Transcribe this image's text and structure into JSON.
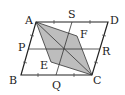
{
  "diagram": {
    "type": "geometry",
    "colors": {
      "line": "#222222",
      "fill": "#bdbdbd",
      "background": "#ffffff"
    },
    "points": {
      "A": {
        "label": "A",
        "x": 36,
        "y": 22
      },
      "D": {
        "label": "D",
        "x": 108,
        "y": 22
      },
      "B": {
        "label": "B",
        "x": 21,
        "y": 75
      },
      "C": {
        "label": "C",
        "x": 92,
        "y": 75
      },
      "S": {
        "label": "S",
        "x": 72,
        "y": 22
      },
      "Q": {
        "label": "Q",
        "x": 56,
        "y": 75
      },
      "P": {
        "label": "P",
        "x": 28,
        "y": 49
      },
      "R": {
        "label": "R",
        "x": 100,
        "y": 49
      },
      "E": {
        "label": "E",
        "x": 51,
        "y": 62
      },
      "F": {
        "label": "F",
        "x": 77,
        "y": 36
      }
    },
    "segments": [
      "AB",
      "BC",
      "CD",
      "DA",
      "SQ",
      "PR",
      "AC"
    ],
    "shaded": [
      "A",
      "F",
      "C",
      "E"
    ]
  }
}
